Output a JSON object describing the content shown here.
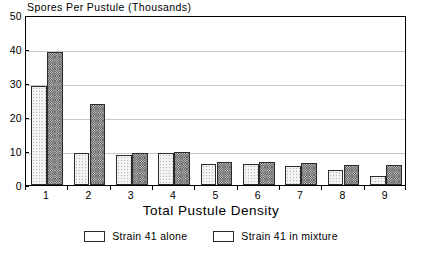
{
  "chart_data": {
    "type": "bar",
    "title": "Spores Per Pustule (Thousands)",
    "xlabel": "Total Pustule Density",
    "ylabel": "",
    "categories": [
      "1",
      "2",
      "3",
      "4",
      "5",
      "6",
      "7",
      "8",
      "9"
    ],
    "series": [
      {
        "name": "Strain 41 alone",
        "values": [
          29,
          9.5,
          8.7,
          9.3,
          6.1,
          6.1,
          5.6,
          4.5,
          2.7
        ],
        "pattern": "light-dotted",
        "color": "#f2f2f2"
      },
      {
        "name": "Strain 41 in mixture",
        "values": [
          39,
          23.7,
          9.3,
          9.7,
          6.8,
          6.8,
          6.4,
          6.0,
          6.0
        ],
        "pattern": "dark-checkered",
        "color": "#808080"
      }
    ],
    "ylim": [
      0,
      50
    ],
    "yticks": [
      0,
      10,
      20,
      30,
      40,
      50
    ],
    "ytick_labels": [
      "0",
      "10",
      "20",
      "30",
      "40",
      "50"
    ],
    "grid": true,
    "grid_axis": "y",
    "legend_position": "bottom-center",
    "frame": true
  },
  "legend": {
    "items": [
      {
        "label": "Strain 41 alone"
      },
      {
        "label": "Strain 41 in mixture"
      }
    ]
  }
}
